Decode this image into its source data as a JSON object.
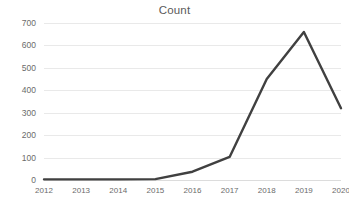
{
  "chart_data": {
    "type": "line",
    "title": "Count",
    "xlabel": "",
    "ylabel": "",
    "categories": [
      "2012",
      "2013",
      "2014",
      "2015",
      "2016",
      "2017",
      "2018",
      "2019",
      "2020"
    ],
    "values": [
      3,
      3,
      3,
      4,
      37,
      103,
      450,
      660,
      320
    ],
    "series": [
      {
        "name": "Count",
        "values": [
          3,
          3,
          3,
          4,
          37,
          103,
          450,
          660,
          320
        ]
      }
    ],
    "ylim": [
      0,
      700
    ],
    "yticks": [
      0,
      100,
      200,
      300,
      400,
      500,
      600,
      700
    ],
    "ytick_labels": [
      "0",
      "100",
      "200",
      "300",
      "400",
      "500",
      "600",
      "700"
    ],
    "grid": true,
    "grid_axis": "y",
    "legend": false,
    "legend_position": "none",
    "line_color": "#404040",
    "line_width": 2.4,
    "background_color": "#ffffff",
    "grid_color": "#e9e9e9",
    "text_color": "#6b6b6b",
    "title_color": "#5a5a5a"
  }
}
